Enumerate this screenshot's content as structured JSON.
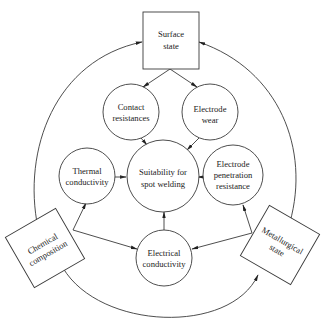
{
  "diagram": {
    "title": "",
    "center": {
      "line1": "Suitability for",
      "line2": "spot welding"
    },
    "nodes": {
      "surface_state": {
        "line1": "Surface",
        "line2": "state"
      },
      "contact_resistances": {
        "line1": "Contact",
        "line2": "resistances"
      },
      "electrode_wear": {
        "line1": "Electrode",
        "line2": "wear"
      },
      "thermal_conductivity": {
        "line1": "Thermal",
        "line2": "conductivity"
      },
      "electrode_penetration_resistance": {
        "line1": "Electrode",
        "line2": "penetration",
        "line3": "resistance"
      },
      "electrical_conductivity": {
        "line1": "Electrical",
        "line2": "conductivity"
      },
      "chemical_composition": {
        "line1": "Chemical",
        "line2": "composition"
      },
      "metallurgical_state": {
        "line1": "Metallurgical",
        "line2": "state"
      }
    },
    "edges": [
      {
        "from": "Surface state",
        "to": "Contact resistances"
      },
      {
        "from": "Surface state",
        "to": "Electrode wear"
      },
      {
        "from": "Contact resistances",
        "to": "Suitability for spot welding"
      },
      {
        "from": "Electrode wear",
        "to": "Suitability for spot welding"
      },
      {
        "from": "Thermal conductivity",
        "to": "Suitability for spot welding"
      },
      {
        "from": "Electrode penetration resistance",
        "to": "Suitability for spot welding"
      },
      {
        "from": "Electrical conductivity",
        "to": "Suitability for spot welding"
      },
      {
        "from": "Chemical composition",
        "to": "Thermal conductivity"
      },
      {
        "from": "Chemical composition",
        "to": "Electrical conductivity"
      },
      {
        "from": "Metallurgical state",
        "to": "Electrode penetration resistance"
      },
      {
        "from": "Metallurgical state",
        "to": "Electrical conductivity"
      },
      {
        "from": "Chemical composition",
        "to": "Surface state"
      },
      {
        "from": "Metallurgical state",
        "to": "Surface state"
      },
      {
        "from": "Chemical composition",
        "to": "Metallurgical state"
      }
    ],
    "colors": {
      "line": "#3a3a3a",
      "background": "#ffffff",
      "text": "#222222"
    }
  }
}
